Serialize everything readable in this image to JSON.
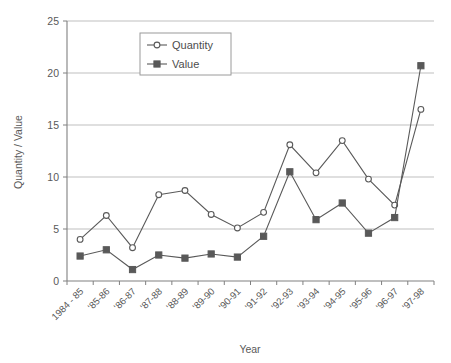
{
  "chart_data": {
    "type": "line",
    "title": "",
    "xlabel": "Year",
    "ylabel": "Quantity / Value",
    "ylim": [
      0,
      25
    ],
    "yticks": [
      0,
      5,
      10,
      15,
      20,
      25
    ],
    "ytick_labels": [
      "0",
      "5",
      "10",
      "15",
      "20",
      "25"
    ],
    "grid": "horizontal",
    "legend_position": "top-center-inside",
    "categories": [
      "1984 - 85",
      "'85-86",
      "'86-87",
      "'87-88",
      "'88-89",
      "'89-90",
      "'90-91",
      "'91-92",
      "'92-93",
      "'93-94",
      "'94-95",
      "'95-96",
      "'96-97",
      "'97-98"
    ],
    "series": [
      {
        "name": "Quantity",
        "marker": "open-circle",
        "color": "#595959",
        "values": [
          4.0,
          6.3,
          3.2,
          8.3,
          8.7,
          6.4,
          5.1,
          6.6,
          13.1,
          10.4,
          13.5,
          9.8,
          7.3,
          16.5
        ]
      },
      {
        "name": "Value",
        "marker": "filled-square",
        "color": "#595959",
        "values": [
          2.4,
          3.0,
          1.1,
          2.5,
          2.2,
          2.6,
          2.3,
          4.3,
          10.5,
          5.9,
          7.5,
          4.6,
          6.1,
          20.7
        ]
      }
    ]
  },
  "legend": {
    "entries": [
      {
        "label": "Quantity"
      },
      {
        "label": "Value"
      }
    ]
  },
  "axes": {
    "x_title": "Year",
    "y_title": "Quantity / Value"
  },
  "colors": {
    "line": "#595959",
    "grid": "#bfbfbf",
    "axis": "#808080",
    "text": "#595959",
    "marker_fill": "#595959",
    "marker_open": "#ffffff",
    "background": "#ffffff"
  }
}
